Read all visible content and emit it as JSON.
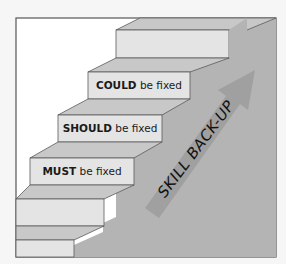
{
  "diagram": {
    "type": "staircase",
    "colors": {
      "background": "#f6f6f6",
      "frame_inner": "#ffffff",
      "frame_border": "#555555",
      "step_face": "#e4e4e4",
      "step_top": "#c8c8c8",
      "wall": "#b4b4b4",
      "arrow": "#a0a0a0",
      "edge": "#5a5a5a"
    },
    "steps": [
      {
        "strong": "COULD",
        "rest": " be fixed"
      },
      {
        "strong": "SHOULD",
        "rest": " be fixed"
      },
      {
        "strong": "MUST",
        "rest": " be fixed"
      }
    ],
    "arrow_label": "SKILL BACK-UP"
  }
}
